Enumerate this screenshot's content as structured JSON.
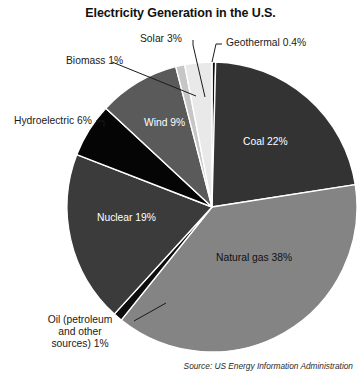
{
  "chart_data": {
    "type": "pie",
    "title": "Electricity Generation in the U.S.",
    "source": "Source: US Energy Information Administration",
    "xlabel": "",
    "ylabel": "",
    "legend_position": "none",
    "grid": false,
    "categories": [
      "Geothermal",
      "Coal",
      "Natural gas",
      "Oil (petroleum and other sources)",
      "Nuclear",
      "Hydroelectric",
      "Wind",
      "Biomass",
      "Solar"
    ],
    "values": [
      0.4,
      22,
      38,
      1,
      19,
      6,
      9,
      1,
      3
    ],
    "slices": [
      {
        "name": "Geothermal",
        "label": "Geothermal 0.4%",
        "value": 0.4,
        "color": "#0d0d0d",
        "label_placement": "external"
      },
      {
        "name": "Coal",
        "label": "Coal 22%",
        "value": 22,
        "color": "#333333",
        "label_placement": "internal",
        "label_color": "#ffffff"
      },
      {
        "name": "Natural gas",
        "label": "Natural gas 38%",
        "value": 38,
        "color": "#848484",
        "label_placement": "internal",
        "label_color": "#111111"
      },
      {
        "name": "Oil",
        "label_lines": [
          "Oil (petroleum",
          "and other",
          "sources) 1%"
        ],
        "label": "Oil (petroleum and other sources) 1%",
        "value": 1,
        "color": "#0d0d0d",
        "label_placement": "external"
      },
      {
        "name": "Nuclear",
        "label": "Nuclear 19%",
        "value": 19,
        "color": "#3b3b3b",
        "label_placement": "internal",
        "label_color": "#ffffff"
      },
      {
        "name": "Hydroelectric",
        "label": "Hydroelectric 6%",
        "value": 6,
        "color": "#050505",
        "label_placement": "external"
      },
      {
        "name": "Wind",
        "label": "Wind 9%",
        "value": 9,
        "color": "#5a5a5a",
        "label_placement": "internal",
        "label_color": "#ffffff"
      },
      {
        "name": "Biomass",
        "label": "Biomass 1%",
        "value": 1,
        "color": "#c6c6c6",
        "label_placement": "external"
      },
      {
        "name": "Solar",
        "label": "Solar 3%",
        "value": 3,
        "color": "#e9e9e9",
        "label_placement": "external"
      }
    ],
    "geometry": {
      "center_x": 212,
      "center_y": 207,
      "radius": 145,
      "start_angle_deg": -90,
      "direction": "clockwise",
      "separator_color": "#ffffff"
    }
  }
}
